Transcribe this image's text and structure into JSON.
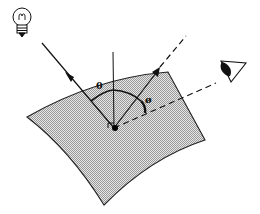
{
  "diagram": {
    "labels": {
      "incident_angle": "θ",
      "view_angle": "ø"
    },
    "elements": {
      "light_source": "light-bulb",
      "viewer": "eye",
      "surface": "curved shaded surface patch",
      "normal": "surface normal (vertical line)",
      "right_angle_marker": "right angle at surface point"
    },
    "colors": {
      "ink": "#111111",
      "surface_fill": "#c8c8c8",
      "background": "#ffffff"
    }
  }
}
